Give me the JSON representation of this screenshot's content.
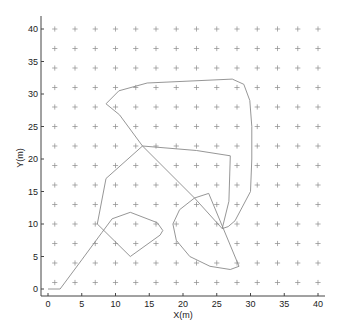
{
  "chart_data": {
    "type": "line",
    "title": "",
    "xlabel": "X(m)",
    "ylabel": "Y(m)",
    "xlim": [
      -1,
      42
    ],
    "ylim": [
      -1,
      42
    ],
    "xticks": [
      0,
      5,
      10,
      15,
      20,
      25,
      30,
      35,
      40
    ],
    "yticks": [
      0,
      5,
      10,
      15,
      20,
      25,
      30,
      35,
      40
    ],
    "grid": false,
    "legend": null,
    "marker_grid": {
      "marker": "+",
      "x": [
        1,
        4,
        7,
        10,
        13,
        16,
        19,
        22,
        25,
        28,
        31,
        34,
        37,
        40
      ],
      "y": [
        1,
        4,
        7,
        10,
        13,
        16,
        19,
        22,
        25,
        28,
        31,
        34,
        37,
        40
      ]
    },
    "series": [
      {
        "name": "trajectory",
        "x": [
          0,
          1.8,
          5,
          8,
          9.5,
          12.2,
          16.2,
          17,
          16.6,
          12.2,
          7.3,
          8.6,
          14,
          22,
          27,
          26.8,
          25.8,
          26.7,
          27.7,
          30,
          30.2,
          30.2,
          29.9,
          29,
          27.3,
          14.7,
          10.5,
          8.6,
          10.6,
          14,
          21.7,
          23.8,
          28.3,
          27,
          24,
          21,
          19,
          18.5,
          19.5,
          21.7,
          25.8
        ],
        "y": [
          0,
          0,
          4.5,
          8.7,
          10.8,
          11.8,
          10.2,
          9,
          8.3,
          5,
          10,
          17,
          22,
          21.3,
          20.5,
          13.5,
          9.3,
          9.6,
          10.5,
          15,
          20,
          25,
          29,
          31.5,
          32.3,
          31.7,
          30.5,
          28.5,
          26.8,
          22,
          14,
          14.7,
          3.5,
          3,
          3.5,
          5,
          7.5,
          10,
          12.2,
          14,
          9.3
        ]
      }
    ]
  },
  "axes": {
    "xlabel": "X(m)",
    "ylabel": "Y(m)",
    "xtick_labels": [
      "0",
      "5",
      "10",
      "15",
      "20",
      "25",
      "30",
      "35",
      "40"
    ],
    "ytick_labels": [
      "0",
      "5",
      "10",
      "15",
      "20",
      "25",
      "30",
      "35",
      "40"
    ]
  },
  "colors": {
    "line": "#8a8a8a",
    "marker": "#8a8a8a",
    "axis": "#444444"
  }
}
